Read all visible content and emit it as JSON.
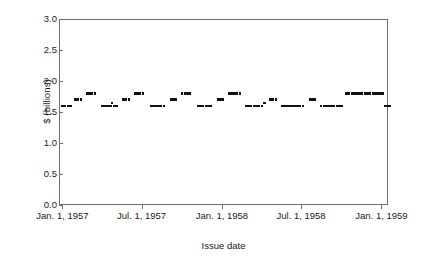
{
  "chart_data": {
    "type": "scatter",
    "title": "",
    "xlabel": "Issue date",
    "ylabel": "$ (billions)",
    "ylim": [
      0.0,
      3.0
    ],
    "ytick_labels": [
      "3.0",
      "2.5",
      "2.0",
      "1.5",
      "1.0",
      "0.5",
      "0.0"
    ],
    "ytick_values": [
      3.0,
      2.5,
      2.0,
      1.5,
      1.0,
      0.5,
      0.0
    ],
    "xtick_labels": [
      "Jan. 1, 1957",
      "Jul. 1, 1957",
      "Jan. 1, 1958",
      "Jul. 1, 1958",
      "Jan. 1, 1959"
    ],
    "xtick_values": [
      0,
      181,
      365,
      546,
      730
    ],
    "xlim": [
      -8,
      745
    ],
    "grid": false,
    "legend": null,
    "marker": "square",
    "marker_color": "#111111",
    "frame_color": "#6e6e6e",
    "series": [
      {
        "name": "Issue amount",
        "points": [
          [
            0,
            1.6
          ],
          [
            6,
            1.6
          ],
          [
            12,
            1.6
          ],
          [
            18,
            1.6
          ],
          [
            30,
            1.7
          ],
          [
            36,
            1.7
          ],
          [
            42,
            1.7
          ],
          [
            56,
            1.8
          ],
          [
            62,
            1.8
          ],
          [
            68,
            1.8
          ],
          [
            74,
            1.8
          ],
          [
            92,
            1.6
          ],
          [
            98,
            1.6
          ],
          [
            104,
            1.6
          ],
          [
            110,
            1.6
          ],
          [
            113,
            1.65
          ],
          [
            119,
            1.6
          ],
          [
            125,
            1.6
          ],
          [
            140,
            1.7
          ],
          [
            146,
            1.7
          ],
          [
            152,
            1.7
          ],
          [
            166,
            1.8
          ],
          [
            172,
            1.8
          ],
          [
            178,
            1.8
          ],
          [
            184,
            1.8
          ],
          [
            202,
            1.6
          ],
          [
            208,
            1.6
          ],
          [
            214,
            1.6
          ],
          [
            220,
            1.6
          ],
          [
            226,
            1.6
          ],
          [
            232,
            1.6
          ],
          [
            248,
            1.7
          ],
          [
            254,
            1.7
          ],
          [
            260,
            1.7
          ],
          [
            274,
            1.8
          ],
          [
            280,
            1.8
          ],
          [
            286,
            1.8
          ],
          [
            292,
            1.8
          ],
          [
            310,
            1.6
          ],
          [
            316,
            1.6
          ],
          [
            322,
            1.6
          ],
          [
            328,
            1.6
          ],
          [
            334,
            1.6
          ],
          [
            340,
            1.6
          ],
          [
            356,
            1.7
          ],
          [
            362,
            1.7
          ],
          [
            368,
            1.7
          ],
          [
            382,
            1.8
          ],
          [
            388,
            1.8
          ],
          [
            394,
            1.8
          ],
          [
            400,
            1.8
          ],
          [
            406,
            1.8
          ],
          [
            420,
            1.6
          ],
          [
            426,
            1.6
          ],
          [
            432,
            1.6
          ],
          [
            438,
            1.6
          ],
          [
            444,
            1.6
          ],
          [
            450,
            1.6
          ],
          [
            456,
            1.6
          ],
          [
            462,
            1.65
          ],
          [
            476,
            1.7
          ],
          [
            482,
            1.7
          ],
          [
            488,
            1.7
          ],
          [
            502,
            1.6
          ],
          [
            508,
            1.6
          ],
          [
            514,
            1.6
          ],
          [
            520,
            1.6
          ],
          [
            526,
            1.6
          ],
          [
            532,
            1.6
          ],
          [
            538,
            1.6
          ],
          [
            544,
            1.6
          ],
          [
            550,
            1.6
          ],
          [
            566,
            1.7
          ],
          [
            572,
            1.7
          ],
          [
            578,
            1.7
          ],
          [
            592,
            1.6
          ],
          [
            598,
            1.6
          ],
          [
            604,
            1.6
          ],
          [
            610,
            1.6
          ],
          [
            616,
            1.6
          ],
          [
            622,
            1.6
          ],
          [
            628,
            1.6
          ],
          [
            634,
            1.6
          ],
          [
            640,
            1.6
          ],
          [
            650,
            1.8
          ],
          [
            656,
            1.8
          ],
          [
            662,
            1.8
          ],
          [
            668,
            1.8
          ],
          [
            674,
            1.8
          ],
          [
            680,
            1.8
          ],
          [
            686,
            1.8
          ],
          [
            692,
            1.8
          ],
          [
            698,
            1.8
          ],
          [
            704,
            1.8
          ],
          [
            710,
            1.8
          ],
          [
            716,
            1.8
          ],
          [
            722,
            1.8
          ],
          [
            728,
            1.8
          ],
          [
            734,
            1.8
          ],
          [
            738,
            1.6
          ],
          [
            742,
            1.6
          ],
          [
            746,
            1.6
          ],
          [
            750,
            1.6
          ]
        ]
      }
    ]
  }
}
